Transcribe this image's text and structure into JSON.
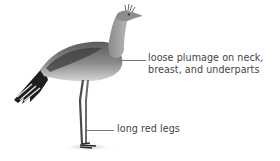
{
  "diagram": {
    "annotations": [
      {
        "id": "plumage",
        "lines": [
          "loose plumage on neck,",
          "breast, and underparts"
        ]
      },
      {
        "id": "legs",
        "lines": [
          "long red legs"
        ]
      }
    ],
    "colors": {
      "background": "#ffffff",
      "label_text": "#444444",
      "leader_line": "#777777",
      "bird_dark": "#2a2a2a",
      "bird_mid": "#7a7a7a",
      "bird_light": "#c9c9c9"
    }
  }
}
